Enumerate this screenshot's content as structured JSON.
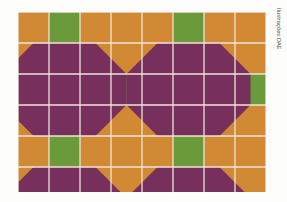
{
  "figure": {
    "credit": "Ilustrações DAE",
    "background_color": "#fdfdfb"
  },
  "palette": {
    "orange": "#d18a33",
    "purple": "#77305c",
    "green": "#6b9a3a",
    "gridline": "#efe4d8",
    "gridline_light": "#f3ece2"
  },
  "chart_data": {
    "type": "heatmap",
    "xlabel": "",
    "ylabel": "",
    "columns": 8,
    "rows": 6,
    "cell_size": 31,
    "grid": true,
    "legend": [
      {
        "name": "orange",
        "color": "#d18a33"
      },
      {
        "name": "purple",
        "color": "#77305c"
      },
      {
        "name": "green",
        "color": "#6b9a3a"
      }
    ],
    "base_fill": "orange",
    "cells": [
      [
        "orange",
        "green",
        "orange",
        "orange",
        "orange",
        "green",
        "orange",
        "orange"
      ],
      [
        "orange",
        "purple",
        "purple",
        "orange",
        "orange",
        "purple",
        "purple",
        "orange"
      ],
      [
        "purple",
        "purple",
        "purple",
        "green",
        "purple",
        "purple",
        "purple",
        "green"
      ],
      [
        "purple",
        "purple",
        "purple",
        "orange",
        "purple",
        "purple",
        "purple",
        "orange"
      ],
      [
        "orange",
        "green",
        "orange",
        "orange",
        "orange",
        "green",
        "orange",
        "orange"
      ],
      [
        "orange",
        "purple",
        "purple",
        "orange",
        "orange",
        "purple",
        "purple",
        "orange"
      ]
    ],
    "motifs": [
      {
        "shape": "octagon",
        "color": "purple",
        "center_col": 1.5,
        "center_row": 2.5,
        "half_width": 2.0,
        "half_height": 1.5,
        "corner_cut": 1.0
      },
      {
        "shape": "octagon",
        "color": "purple",
        "center_col": 5.5,
        "center_row": 2.5,
        "half_width": 2.0,
        "half_height": 1.5,
        "corner_cut": 1.0
      },
      {
        "shape": "trapezoid",
        "color": "purple",
        "center_col": 1.5,
        "top_row": 5.0,
        "bottom_row": 6.0,
        "top_half_width": 1.0,
        "bottom_half_width": 2.0
      },
      {
        "shape": "trapezoid",
        "color": "purple",
        "center_col": 5.5,
        "top_row": 5.0,
        "bottom_row": 6.0,
        "top_half_width": 1.0,
        "bottom_half_width": 2.0
      }
    ],
    "green_squares": [
      {
        "col": 1,
        "row": 0
      },
      {
        "col": 5,
        "row": 0
      },
      {
        "col": 3,
        "row": 2
      },
      {
        "col": 7,
        "row": 2
      },
      {
        "col": 1,
        "row": 4
      },
      {
        "col": 5,
        "row": 4
      }
    ]
  }
}
